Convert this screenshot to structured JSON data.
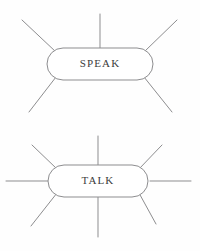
{
  "diagram": {
    "type": "word-web",
    "background_color": "#fefefe",
    "line_color": "#8d8d8f",
    "text_color": "#3c3c3c",
    "nodes": [
      {
        "id": "speak",
        "label": "SPEAK",
        "shape": "rounded-lozenge",
        "cx": 100,
        "cy": 64,
        "rx": 53,
        "ry": 16,
        "spoke_count": 5,
        "spokes": [
          {
            "name": "top-left-spoke",
            "x1": 56,
            "y1": 52,
            "x2": 22,
            "y2": 20
          },
          {
            "name": "top-center-spoke",
            "x1": 100,
            "y1": 48,
            "x2": 100,
            "y2": 14
          },
          {
            "name": "top-right-spoke",
            "x1": 144,
            "y1": 52,
            "x2": 177,
            "y2": 20
          },
          {
            "name": "bottom-left-spoke",
            "x1": 56,
            "y1": 77,
            "x2": 29,
            "y2": 112
          },
          {
            "name": "bottom-right-spoke",
            "x1": 144,
            "y1": 77,
            "x2": 172,
            "y2": 112
          }
        ]
      },
      {
        "id": "talk",
        "label": "TALK",
        "shape": "rounded-lozenge",
        "cx": 98,
        "cy": 181,
        "rx": 50,
        "ry": 16,
        "spoke_count": 8,
        "spokes": [
          {
            "name": "top-left-spoke",
            "x1": 57,
            "y1": 169,
            "x2": 32,
            "y2": 145
          },
          {
            "name": "top-center-spoke",
            "x1": 98,
            "y1": 165,
            "x2": 98,
            "y2": 136
          },
          {
            "name": "top-right-spoke",
            "x1": 139,
            "y1": 169,
            "x2": 162,
            "y2": 145
          },
          {
            "name": "left-spoke",
            "x1": 48,
            "y1": 181,
            "x2": 6,
            "y2": 181
          },
          {
            "name": "right-spoke",
            "x1": 150,
            "y1": 181,
            "x2": 191,
            "y2": 181
          },
          {
            "name": "bottom-left-spoke",
            "x1": 57,
            "y1": 193,
            "x2": 31,
            "y2": 226
          },
          {
            "name": "bottom-center-spoke",
            "x1": 98,
            "y1": 197,
            "x2": 98,
            "y2": 237
          },
          {
            "name": "bottom-right-spoke",
            "x1": 139,
            "y1": 193,
            "x2": 156,
            "y2": 224
          }
        ]
      }
    ]
  }
}
